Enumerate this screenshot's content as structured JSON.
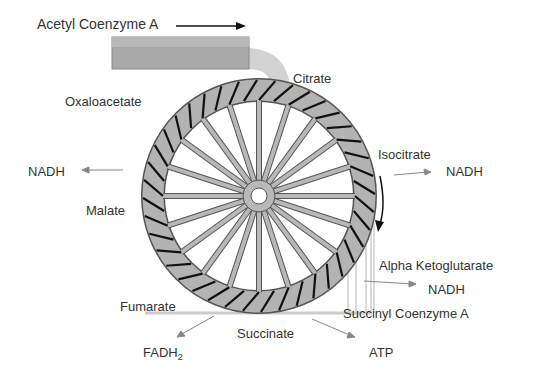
{
  "diagram": {
    "input": {
      "label": "Acetyl Coenzyme A"
    },
    "intermediates": [
      {
        "id": "citrate",
        "label": "Citrate"
      },
      {
        "id": "isocitrate",
        "label": "Isocitrate"
      },
      {
        "id": "alpha-ketoglutarate",
        "label": "Alpha Ketoglutarate"
      },
      {
        "id": "succinyl-coa",
        "label": "Succinyl Coenzyme A"
      },
      {
        "id": "succinate",
        "label": "Succinate"
      },
      {
        "id": "fumarate",
        "label": "Fumarate"
      },
      {
        "id": "malate",
        "label": "Malate"
      },
      {
        "id": "oxaloacetate",
        "label": "Oxaloacetate"
      }
    ],
    "products": [
      {
        "id": "nadh-isocitrate",
        "label": "NADH",
        "from": "Isocitrate"
      },
      {
        "id": "nadh-akg",
        "label": "NADH",
        "from": "Alpha Ketoglutarate"
      },
      {
        "id": "atp",
        "label": "ATP",
        "from": "Succinyl Coenzyme A"
      },
      {
        "id": "fadh2",
        "label": "FADH",
        "subscript": "2",
        "from": "Succinate"
      },
      {
        "id": "nadh-malate",
        "label": "NADH",
        "from": "Malate"
      }
    ],
    "wheel": {
      "spokes": 20,
      "paddles": 40,
      "rotation": "clockwise"
    },
    "colors": {
      "ring": "#b3b3b3",
      "trough": "#a6a6a6",
      "paddle": "#111111",
      "text": "#333333",
      "water": "#d0d0d0"
    }
  }
}
